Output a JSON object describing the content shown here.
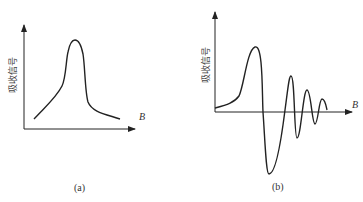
{
  "panels": [
    {
      "id": "a",
      "caption": "(a)",
      "y_label": "吸收信号",
      "x_label": "B",
      "curve": "single absorption peak"
    },
    {
      "id": "b",
      "caption": "(b)",
      "y_label": "吸收信号",
      "x_label": "B",
      "curve": "damped oscillation (wiggles)"
    }
  ],
  "colors": {
    "line": "#222222",
    "text": "#333333"
  }
}
